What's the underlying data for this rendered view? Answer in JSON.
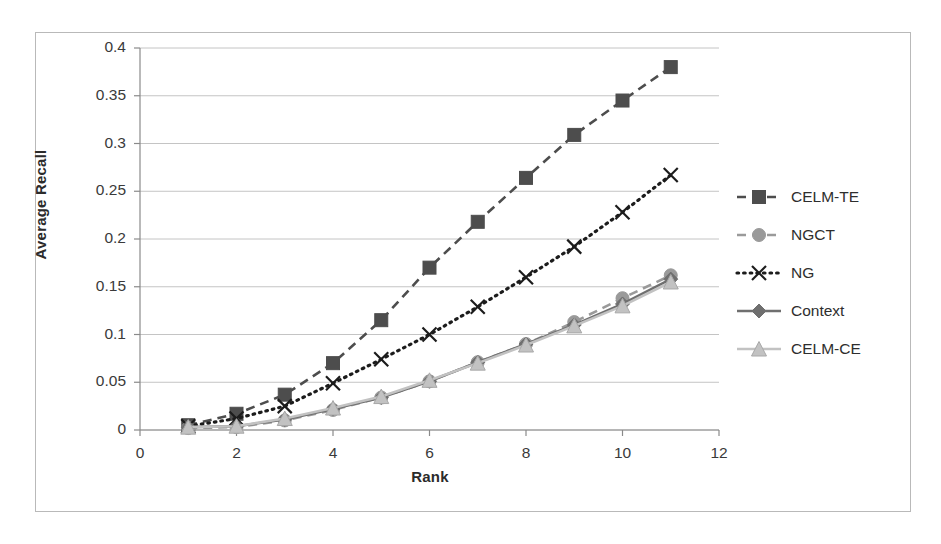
{
  "chart_data": {
    "type": "line",
    "title": "",
    "xlabel": "Rank",
    "ylabel": "Average Recall",
    "xlim": [
      0,
      12
    ],
    "ylim": [
      0,
      0.4
    ],
    "xticks": [
      0,
      2,
      4,
      6,
      8,
      10,
      12
    ],
    "xtick_labels": [
      "0",
      "2",
      "4",
      "6",
      "8",
      "10",
      "12"
    ],
    "yticks": [
      0,
      0.05,
      0.1,
      0.15,
      0.2,
      0.25,
      0.3,
      0.35,
      0.4
    ],
    "ytick_labels": [
      "0",
      "0.05",
      "0.1",
      "0.15",
      "0.2",
      "0.25",
      "0.3",
      "0.35",
      "0.4"
    ],
    "grid": "horizontal",
    "legend_position": "right",
    "x": [
      1,
      2,
      3,
      4,
      5,
      6,
      7,
      8,
      9,
      10,
      11
    ],
    "series": [
      {
        "name": "CELM-TE",
        "marker": "square",
        "line": "dashed",
        "color": "#4d4d4d",
        "values": [
          0.005,
          0.017,
          0.037,
          0.07,
          0.115,
          0.17,
          0.218,
          0.264,
          0.309,
          0.345,
          0.38
        ]
      },
      {
        "name": "NGCT",
        "marker": "circle",
        "line": "dashed",
        "color": "#9a9a9a",
        "values": [
          0.002,
          0.003,
          0.01,
          0.021,
          0.034,
          0.051,
          0.071,
          0.09,
          0.113,
          0.138,
          0.162
        ]
      },
      {
        "name": "NG",
        "marker": "cross",
        "line": "dotted",
        "color": "#1c1c1c",
        "values": [
          0.004,
          0.012,
          0.025,
          0.049,
          0.074,
          0.1,
          0.129,
          0.16,
          0.192,
          0.228,
          0.267
        ]
      },
      {
        "name": "Context",
        "marker": "diamond",
        "line": "solid",
        "color": "#6f6f6f",
        "values": [
          0.003,
          0.004,
          0.011,
          0.022,
          0.034,
          0.051,
          0.071,
          0.09,
          0.11,
          0.132,
          0.158
        ]
      },
      {
        "name": "CELM-CE",
        "marker": "triangle",
        "line": "solid",
        "color": "#c2c2c2",
        "values": [
          0.003,
          0.004,
          0.012,
          0.023,
          0.035,
          0.052,
          0.07,
          0.089,
          0.109,
          0.13,
          0.155
        ]
      }
    ]
  },
  "axes": {
    "y_title": "Average Recall",
    "x_title": "Rank"
  },
  "legend": {
    "items": [
      {
        "label": "CELM-TE"
      },
      {
        "label": "NGCT"
      },
      {
        "label": "NG"
      },
      {
        "label": "NG"
      },
      {
        "label": "CELM-CE"
      }
    ]
  },
  "colors": {
    "frame": "#b9b9b9",
    "grid": "#c4c4c4",
    "axis": "#8a8a8a",
    "background": "#ffffff",
    "text": "#2e2e2e"
  }
}
